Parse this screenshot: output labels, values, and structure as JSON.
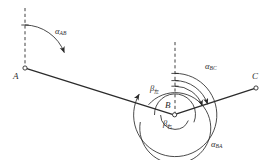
{
  "figure": {
    "background_color": "#ffffff",
    "stroke_color": "#2b2b2b",
    "width": 275,
    "height": 160
  },
  "points": [
    {
      "id": "A",
      "label": "A",
      "x": 25,
      "y": 68,
      "label_x": 13,
      "label_y": 72
    },
    {
      "id": "B",
      "label": "B",
      "x": 174,
      "y": 115,
      "label_x": 165,
      "label_y": 101
    },
    {
      "id": "C",
      "label": "C",
      "x": 256,
      "y": 88,
      "label_x": 252,
      "label_y": 72
    }
  ],
  "lines": [
    {
      "name": "segment-AB",
      "from": "A",
      "to": "B"
    },
    {
      "name": "segment-BC",
      "from": "B",
      "to": "C"
    }
  ],
  "reference_lines": [
    {
      "name": "north-line-A",
      "x": 25,
      "y_top": 8,
      "y_bottom": 68,
      "style": "dashed"
    },
    {
      "name": "north-line-B",
      "x": 175,
      "y_top": 42,
      "y_bottom": 115,
      "style": "dashed"
    }
  ],
  "angles": [
    {
      "id": "alpha_AB",
      "symbol": "α",
      "subscript": "AB",
      "subscript_type": "latin",
      "label_x": 55,
      "label_y": 27,
      "vertex": "A",
      "description": "azimuth of line AB measured from north at A"
    },
    {
      "id": "alpha_BC",
      "symbol": "α",
      "subscript": "BC",
      "subscript_type": "latin",
      "label_x": 205,
      "label_y": 62,
      "vertex": "B",
      "description": "azimuth of line BC measured from north at B"
    },
    {
      "id": "alpha_BA",
      "symbol": "α",
      "subscript": "BA",
      "subscript_type": "latin",
      "label_x": 211,
      "label_y": 140,
      "vertex": "B",
      "description": "azimuth of line BA measured from north at B"
    },
    {
      "id": "beta_left",
      "symbol": "β",
      "subscript": "左",
      "subscript_type": "cjk",
      "label_x": 150,
      "label_y": 84,
      "vertex": "B",
      "description": "left angle at B"
    },
    {
      "id": "beta_right",
      "symbol": "β",
      "subscript": "右",
      "subscript_type": "cjk",
      "label_x": 163,
      "label_y": 119,
      "vertex": "B",
      "description": "right angle at B"
    }
  ],
  "markers": {
    "station_marker": "open-circle",
    "station_radius": 2.1
  }
}
